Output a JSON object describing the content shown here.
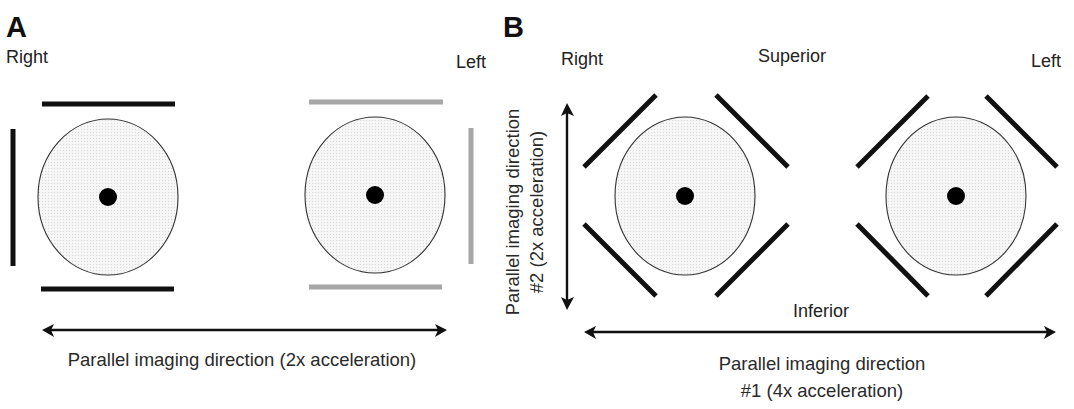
{
  "panel_a": {
    "letter": "A",
    "label_right": "Right",
    "label_left": "Left",
    "caption": "Parallel imaging direction (2x acceleration)",
    "coil_colors": {
      "right_side": "#111111",
      "left_side": "#a6a6a6"
    },
    "phantoms": [
      {
        "cx": 108,
        "cy": 197,
        "rx": 70,
        "ry": 78,
        "dot_r": 9
      },
      {
        "cx": 375,
        "cy": 195,
        "rx": 70,
        "ry": 78,
        "dot_r": 9
      }
    ],
    "arrow": {
      "x1": 42,
      "x2": 447,
      "y": 330,
      "direction": "horizontal",
      "double_headed": true
    }
  },
  "panel_b": {
    "letter": "B",
    "label_right": "Right",
    "label_superior": "Superior",
    "label_left": "Left",
    "label_inferior": "Inferior",
    "caption_1_line1": "Parallel imaging direction",
    "caption_1_line2": "#1 (4x acceleration)",
    "caption_2_line1": "Parallel imaging direction",
    "caption_2_line2": "#2 (2x acceleration)",
    "coil_color": "#111111",
    "phantoms": [
      {
        "cx": 685,
        "cy": 196,
        "rx": 70,
        "ry": 79,
        "dot_r": 9
      },
      {
        "cx": 956,
        "cy": 196,
        "rx": 70,
        "ry": 79,
        "dot_r": 9
      }
    ],
    "arrow_horizontal": {
      "x1": 584,
      "x2": 1056,
      "y": 332,
      "double_headed": true
    },
    "arrow_vertical": {
      "x": 567,
      "y1": 103,
      "y2": 310,
      "double_headed": true
    }
  }
}
